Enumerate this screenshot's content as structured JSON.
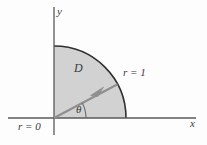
{
  "figure": {
    "background_color": "#fdfdfd",
    "region_fill_color": "#d2d2d2",
    "line_color": "#4a4a4a",
    "ray_color": "#8a8a8a",
    "axes": {
      "x_axis_label": "x",
      "y_axis_label": "y",
      "origin_x": 54,
      "origin_y": 118,
      "x_axis_start": 8,
      "x_axis_end": 196,
      "y_axis_top": 7,
      "y_axis_bottom": 135
    },
    "region": {
      "label": "D",
      "radius_px": 72,
      "start_angle_deg": 0,
      "end_angle_deg": 90
    },
    "annotations": [
      {
        "name": "outer-radius-label",
        "text": "r = 1"
      },
      {
        "name": "inner-radius-label",
        "text": "r = 0"
      },
      {
        "name": "angle-label",
        "text": "θ"
      },
      {
        "name": "region-label",
        "text": "D"
      },
      {
        "name": "x-axis-label",
        "text": "x"
      },
      {
        "name": "y-axis-label",
        "text": "y"
      }
    ],
    "labels": {
      "x_axis": "x",
      "y_axis": "y",
      "region": "D",
      "outer_radius": "r = 1",
      "inner_radius": "r = 0",
      "angle": "θ"
    },
    "ray": {
      "angle_deg": 28,
      "length_px": 72,
      "has_arrowhead": true
    }
  }
}
